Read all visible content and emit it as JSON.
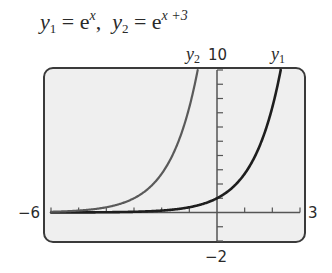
{
  "title": {
    "y1_name": "y",
    "y1_sub": "1",
    "y1_eq": " = e",
    "y1_exp": "x",
    "sep": ",  ",
    "y2_name": "y",
    "y2_sub": "2",
    "y2_eq": " = e",
    "y2_exp": "x +3"
  },
  "window": {
    "xmin_label": "−6",
    "xmax_label": "3",
    "ymin_label": "−2",
    "ymax_label": "10"
  },
  "curve_labels": {
    "y1": {
      "name": "y",
      "sub": "1"
    },
    "y2": {
      "name": "y",
      "sub": "2"
    }
  },
  "colors": {
    "panel_bg": "#efefef",
    "frame": "#3a3a3a",
    "axis": "#555555",
    "y1": "#1e1e1e",
    "y2": "#5a5a5a"
  },
  "chart_data": {
    "type": "line",
    "xlabel": "",
    "ylabel": "",
    "xlim": [
      -6,
      3
    ],
    "ylim": [
      -2,
      10
    ],
    "xscl": 1,
    "yscl": 1,
    "grid": false,
    "legend": "inline curve labels at top (y2 left, y1 right)",
    "series": [
      {
        "name": "y1",
        "expression": "e^x",
        "x": [
          -6,
          -5,
          -4,
          -3,
          -2,
          -1,
          0,
          1,
          2,
          2.303
        ],
        "values": [
          0.0025,
          0.0067,
          0.018,
          0.05,
          0.135,
          0.368,
          1.0,
          2.718,
          7.389,
          10.0
        ]
      },
      {
        "name": "y2",
        "expression": "e^(x+3)",
        "x": [
          -6,
          -5,
          -4,
          -3,
          -2,
          -1,
          -0.697
        ],
        "values": [
          0.05,
          0.135,
          0.368,
          1.0,
          2.718,
          7.389,
          10.0
        ]
      }
    ]
  }
}
